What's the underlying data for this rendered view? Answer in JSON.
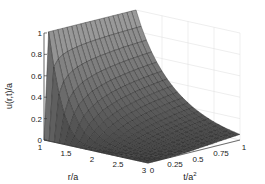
{
  "chart_data": {
    "type": "surface3d",
    "title": "",
    "xlabel": "r/a",
    "ylabel": "t/a²",
    "zlabel": "u(r,t)/a",
    "x_ticks": [
      "1",
      "1.5",
      "2",
      "2.5",
      "3"
    ],
    "y_ticks": [
      "0",
      "0.25",
      "0.5",
      "0.75",
      "1"
    ],
    "z_ticks": [
      "0",
      "0.2",
      "0.4",
      "0.6",
      "0.8",
      "1"
    ],
    "xlim": [
      1,
      3
    ],
    "ylim": [
      0,
      1
    ],
    "zlim": [
      0,
      1
    ],
    "grid": true,
    "colormap": "gray",
    "surface_description": "u/a = 0 at t=0 for all r; u/a = 1 at r=1 for t>0; decays with r, grows with t. Approximate values below.",
    "x": [
      1,
      1.5,
      2,
      2.5,
      3
    ],
    "y": [
      0,
      0.25,
      0.5,
      0.75,
      1
    ],
    "z": [
      [
        0,
        1,
        1,
        1,
        1
      ],
      [
        0,
        0.35,
        0.48,
        0.55,
        0.6
      ],
      [
        0,
        0.13,
        0.24,
        0.31,
        0.36
      ],
      [
        0,
        0.05,
        0.12,
        0.18,
        0.22
      ],
      [
        0,
        0.02,
        0.06,
        0.1,
        0.13
      ]
    ]
  },
  "axes": {
    "z_label": "u(r,t)/a",
    "x_label": "r/a",
    "y_label_base": "t/a",
    "y_label_sup": "2"
  }
}
